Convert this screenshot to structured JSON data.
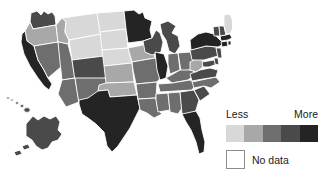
{
  "figure": {
    "type": "choropleth-map",
    "region": "United States",
    "background_color": "#ffffff",
    "border_color": "#ffffff"
  },
  "legend": {
    "low_label": "Less",
    "high_label": "More",
    "nodata_label": "No data",
    "nodata_color": "#ffffff",
    "nodata_border_color": "#8c8c8c",
    "ramp_colors": [
      "#d8d8d8",
      "#a8a8a8",
      "#6e6e6e",
      "#4a4a4a",
      "#242424"
    ]
  },
  "chart_data": {
    "type": "heatmap",
    "title": "",
    "subtitle": "",
    "xlabel": "",
    "ylabel": "",
    "legend_position": "bottom-right",
    "grid": false,
    "scale": "sequential-gray-5-class",
    "class_labels": [
      "Less",
      "More"
    ],
    "class_colors": [
      "#d8d8d8",
      "#a8a8a8",
      "#6e6e6e",
      "#4a4a4a",
      "#242424"
    ],
    "nodata_color": "#ffffff",
    "categories": [
      "Washington",
      "Oregon",
      "California",
      "Nevada",
      "Idaho",
      "Montana",
      "Wyoming",
      "Utah",
      "Colorado",
      "Arizona",
      "New Mexico",
      "North Dakota",
      "South Dakota",
      "Nebraska",
      "Kansas",
      "Oklahoma",
      "Texas",
      "Minnesota",
      "Iowa",
      "Missouri",
      "Arkansas",
      "Louisiana",
      "Wisconsin",
      "Illinois",
      "Michigan",
      "Indiana",
      "Ohio",
      "Kentucky",
      "Tennessee",
      "Mississippi",
      "Alabama",
      "Georgia",
      "Florida",
      "South Carolina",
      "North Carolina",
      "Virginia",
      "West Virginia",
      "Maryland",
      "Delaware",
      "Pennsylvania",
      "New Jersey",
      "New York",
      "Connecticut",
      "Rhode Island",
      "Massachusetts",
      "Vermont",
      "New Hampshire",
      "Maine",
      "Alaska",
      "Hawaii"
    ],
    "values": [
      4,
      2,
      5,
      3,
      2,
      1,
      1,
      3,
      4,
      3,
      3,
      1,
      1,
      1,
      2,
      2,
      5,
      5,
      2,
      3,
      3,
      3,
      4,
      5,
      4,
      3,
      3,
      3,
      3,
      3,
      3,
      4,
      5,
      4,
      3,
      4,
      2,
      4,
      4,
      4,
      4,
      5,
      5,
      5,
      5,
      4,
      4,
      1,
      4,
      4
    ],
    "state_fills": {
      "WA": "#4a4a4a",
      "OR": "#a8a8a8",
      "CA": "#242424",
      "NV": "#6e6e6e",
      "ID": "#a8a8a8",
      "MT": "#d8d8d8",
      "WY": "#d8d8d8",
      "UT": "#6e6e6e",
      "CO": "#4a4a4a",
      "AZ": "#6e6e6e",
      "NM": "#6e6e6e",
      "ND": "#d8d8d8",
      "SD": "#d8d8d8",
      "NE": "#d8d8d8",
      "KS": "#a8a8a8",
      "OK": "#a8a8a8",
      "TX": "#242424",
      "MN": "#242424",
      "IA": "#a8a8a8",
      "MO": "#6e6e6e",
      "AR": "#6e6e6e",
      "LA": "#6e6e6e",
      "WI": "#4a4a4a",
      "IL": "#242424",
      "MI": "#4a4a4a",
      "IN": "#6e6e6e",
      "OH": "#6e6e6e",
      "KY": "#6e6e6e",
      "TN": "#6e6e6e",
      "MS": "#6e6e6e",
      "AL": "#6e6e6e",
      "GA": "#4a4a4a",
      "FL": "#242424",
      "SC": "#4a4a4a",
      "NC": "#6e6e6e",
      "VA": "#4a4a4a",
      "WV": "#a8a8a8",
      "MD": "#4a4a4a",
      "DE": "#4a4a4a",
      "PA": "#4a4a4a",
      "NJ": "#4a4a4a",
      "NY": "#242424",
      "CT": "#242424",
      "RI": "#242424",
      "MA": "#242424",
      "VT": "#4a4a4a",
      "NH": "#4a4a4a",
      "ME": "#d8d8d8",
      "AK": "#4a4a4a",
      "HI": "#4a4a4a"
    }
  }
}
